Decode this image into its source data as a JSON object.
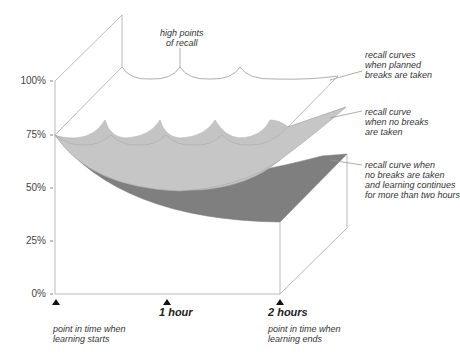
{
  "diagram": {
    "y_axis": {
      "labels": [
        "100%",
        "75%",
        "50%",
        "25%",
        "0%"
      ]
    },
    "x_axis": {
      "ticks": [
        {
          "label": "",
          "note": "point in time when\nlearning starts"
        },
        {
          "label": "1 hour",
          "note": ""
        },
        {
          "label": "2 hours",
          "note": "point in time when\nlearning ends"
        }
      ]
    },
    "annotations": {
      "high_points": "high points\nof recall",
      "planned_breaks": "recall curves\nwhen planned\nbreaks are taken",
      "no_breaks": "recall curve\nwhen no breaks\nare taken",
      "no_breaks_long": "recall curve when\nno breaks are taken\nand learning continues\nfor more than two hours"
    },
    "colors": {
      "light_surface": "#c4c4c4",
      "dark_surface": "#808080",
      "lines": "#a0a0a0"
    }
  }
}
